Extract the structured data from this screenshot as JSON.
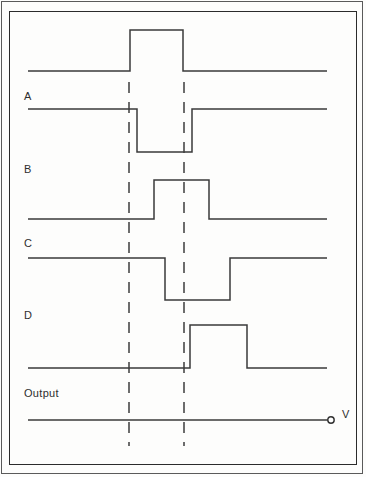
{
  "figure": {
    "kind": "digital-timing-diagram",
    "background_color": "#fdfdfc",
    "line_color": "#3a3a3a",
    "frame_color": "#2b2b2b",
    "dash_color": "#3d3d3d"
  },
  "labels": {
    "a": "A",
    "b": "B",
    "c": "C",
    "d": "D",
    "output": "Output",
    "terminal": "V"
  },
  "chart_data": {
    "type": "line",
    "title": "",
    "xlabel": "",
    "ylabel": "",
    "grid": false,
    "legend": "none",
    "xlim": [
      28,
      327
    ],
    "annotations": [
      {
        "name": "reference-line-1",
        "x": 129,
        "style": "dashed"
      },
      {
        "name": "reference-line-2",
        "x": 184,
        "style": "dashed"
      }
    ],
    "series": [
      {
        "name": "top-waveform",
        "label": "",
        "polarity": "positive-pulse",
        "baseline_y": 71,
        "pulse_y": 30,
        "x_start": 28,
        "x_end": 327,
        "transitions": [
          {
            "x": 130,
            "edge": "rising"
          },
          {
            "x": 183,
            "edge": "falling"
          }
        ]
      },
      {
        "name": "waveform-a",
        "label": "A",
        "polarity": "negative-pulse",
        "baseline_y": 109,
        "pulse_y": 152,
        "x_start": 28,
        "x_end": 327,
        "transitions": [
          {
            "x": 137,
            "edge": "falling"
          },
          {
            "x": 192,
            "edge": "rising"
          }
        ]
      },
      {
        "name": "waveform-b",
        "label": "B",
        "polarity": "positive-pulse",
        "baseline_y": 219,
        "pulse_y": 180,
        "x_start": 28,
        "x_end": 327,
        "transitions": [
          {
            "x": 154,
            "edge": "rising"
          },
          {
            "x": 209,
            "edge": "falling"
          }
        ]
      },
      {
        "name": "waveform-c",
        "label": "C",
        "polarity": "negative-pulse",
        "baseline_y": 258,
        "pulse_y": 300,
        "x_start": 28,
        "x_end": 327,
        "transitions": [
          {
            "x": 165,
            "edge": "falling"
          },
          {
            "x": 230,
            "edge": "rising"
          }
        ]
      },
      {
        "name": "waveform-d",
        "label": "D",
        "polarity": "positive-pulse",
        "baseline_y": 368,
        "pulse_y": 325,
        "x_start": 28,
        "x_end": 327,
        "transitions": [
          {
            "x": 190,
            "edge": "rising"
          },
          {
            "x": 247,
            "edge": "falling"
          }
        ]
      },
      {
        "name": "output-waveform",
        "label": "Output",
        "polarity": "flat",
        "baseline_y": 420,
        "pulse_y": 420,
        "x_start": 28,
        "x_end": 328,
        "transitions": []
      }
    ]
  }
}
